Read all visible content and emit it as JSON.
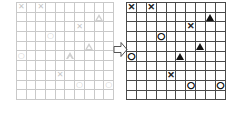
{
  "figure": {
    "type": "grid-transformation-diagram",
    "arrow": {
      "icon": "arrow-right-icon",
      "direction": "right",
      "color": "#555555",
      "fill": "#ffffff"
    },
    "grids": [
      {
        "id": "before",
        "position": "left",
        "rows": 10,
        "cols": 10,
        "line_color": "#c9c9c9",
        "symbol_color": "#cccccc",
        "rendering": "faint"
      },
      {
        "id": "after",
        "position": "right",
        "rows": 10,
        "cols": 10,
        "line_color": "#4a4a4a",
        "symbol_color": "#111111",
        "rendering": "bold"
      }
    ],
    "symbol_glyphs": {
      "x": "✕",
      "o": "○",
      "triangle": "▲"
    },
    "symbol_names": {
      "x": "cross-symbol",
      "o": "circle-symbol",
      "triangle": "triangle-symbol"
    },
    "placements": [
      {
        "row": 0,
        "col": 0,
        "symbol": "x"
      },
      {
        "row": 0,
        "col": 2,
        "symbol": "x"
      },
      {
        "row": 1,
        "col": 8,
        "symbol": "triangle"
      },
      {
        "row": 2,
        "col": 6,
        "symbol": "x"
      },
      {
        "row": 3,
        "col": 3,
        "symbol": "o"
      },
      {
        "row": 4,
        "col": 7,
        "symbol": "triangle"
      },
      {
        "row": 5,
        "col": 0,
        "symbol": "o"
      },
      {
        "row": 5,
        "col": 5,
        "symbol": "triangle"
      },
      {
        "row": 7,
        "col": 4,
        "symbol": "x"
      },
      {
        "row": 8,
        "col": 6,
        "symbol": "o"
      },
      {
        "row": 8,
        "col": 9,
        "symbol": "o"
      }
    ]
  }
}
